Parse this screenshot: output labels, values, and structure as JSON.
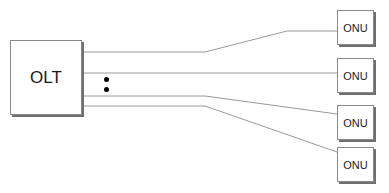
{
  "diagram": {
    "type": "network-topology",
    "olt": {
      "label": "OLT"
    },
    "onus": [
      {
        "label": "ONU"
      },
      {
        "label": "ONU"
      },
      {
        "label": "ONU"
      },
      {
        "label": "ONU"
      }
    ],
    "ellipsis": {
      "dots": 2
    },
    "connections": [
      {
        "from": "OLT",
        "to": "ONU 1"
      },
      {
        "from": "OLT",
        "to": "ONU 2"
      },
      {
        "from": "OLT",
        "to": "ONU 3"
      },
      {
        "from": "OLT",
        "to": "ONU 4"
      }
    ],
    "colors": {
      "line": "#9a9a9a",
      "box_border": "#8a8a8a",
      "shadow": "#6f6f6f",
      "dot": "#000000"
    }
  }
}
